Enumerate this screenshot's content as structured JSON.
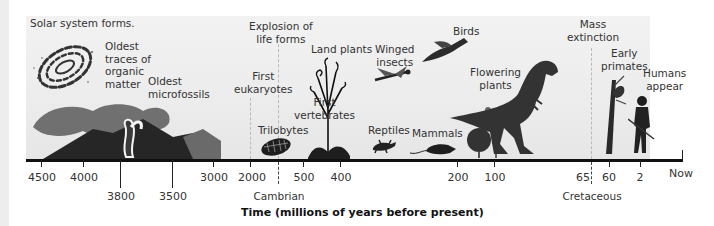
{
  "figure": {
    "axis_title": "Time (millions of years before present)",
    "events": [
      {
        "id": "solar",
        "label": "Solar system forms."
      },
      {
        "id": "organic",
        "label": "Oldest traces of organic matter",
        "lines": [
          "Oldest",
          "traces of",
          "organic",
          "matter"
        ]
      },
      {
        "id": "microfossils",
        "label": "Oldest microfossils",
        "lines": [
          "Oldest",
          "microfossils"
        ]
      },
      {
        "id": "eukaryotes",
        "label": "First eukaryotes",
        "lines": [
          "First",
          "eukaryotes"
        ]
      },
      {
        "id": "explosion",
        "label": "Explosion of life forms",
        "lines": [
          "Explosion of",
          "life forms"
        ]
      },
      {
        "id": "trilobytes",
        "label": "Trilobytes"
      },
      {
        "id": "vertebrates",
        "label": "First vertebrates",
        "lines": [
          "First",
          "vertebrates"
        ]
      },
      {
        "id": "landplants",
        "label": "Land plants"
      },
      {
        "id": "insects",
        "label": "Winged insects",
        "lines": [
          "Winged",
          "insects"
        ]
      },
      {
        "id": "reptiles",
        "label": "Reptiles"
      },
      {
        "id": "birds",
        "label": "Birds"
      },
      {
        "id": "mammals",
        "label": "Mammals"
      },
      {
        "id": "flowering",
        "label": "Flowering plants",
        "lines": [
          "Flowering",
          "plants"
        ]
      },
      {
        "id": "extinction",
        "label": "Mass extinction",
        "lines": [
          "Mass",
          "extinction"
        ]
      },
      {
        "id": "primates",
        "label": "Early primates",
        "lines": [
          "Early",
          "primates"
        ]
      },
      {
        "id": "humans",
        "label": "Humans appear",
        "lines": [
          "Humans",
          "appear"
        ]
      }
    ],
    "ticks": [
      {
        "label": "4500",
        "row": "upper"
      },
      {
        "label": "4000",
        "row": "upper"
      },
      {
        "label": "3800",
        "row": "lower"
      },
      {
        "label": "3500",
        "row": "lower"
      },
      {
        "label": "3000",
        "row": "upper"
      },
      {
        "label": "2000",
        "row": "upper"
      },
      {
        "label": "500",
        "row": "upper"
      },
      {
        "label": "400",
        "row": "upper"
      },
      {
        "label": "200",
        "row": "upper"
      },
      {
        "label": "100",
        "row": "upper"
      },
      {
        "label": "65",
        "row": "upper"
      },
      {
        "label": "60",
        "row": "upper"
      },
      {
        "label": "2",
        "row": "upper"
      },
      {
        "label": "Now",
        "row": "upper"
      }
    ],
    "period_markers": [
      {
        "label": "Cambrian",
        "style": "dashed"
      },
      {
        "label": "Cretaceous",
        "style": "dashed"
      }
    ],
    "illustrations": [
      "galaxy",
      "volcanoes",
      "stromatolite-column",
      "trilobyte",
      "fern",
      "land-plant",
      "dragonfly",
      "lizard",
      "archaeopteryx",
      "rat",
      "shrub",
      "flowering-tree",
      "tyrannosaurus",
      "primate-in-tree",
      "early-human"
    ]
  }
}
